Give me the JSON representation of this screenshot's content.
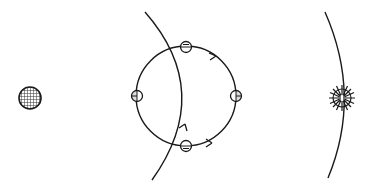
{
  "diagram": {
    "width": 367,
    "height": 185,
    "background": "#ffffff",
    "stroke": "#1a1a1a",
    "elements": {
      "hatched_disc": {
        "cx": 30,
        "cy": 98,
        "r": 11,
        "fill": "hatched"
      },
      "orbit_circle": {
        "cx": 186,
        "cy": 96,
        "r": 51,
        "arrows": [
          "upper-right",
          "lower-right",
          "crossing-arc-bottom"
        ]
      },
      "markers": [
        {
          "name": "top",
          "cx": 186,
          "cy": 47,
          "r": 6,
          "pattern": "upper-half-lines"
        },
        {
          "name": "left",
          "cx": 137,
          "cy": 96,
          "r": 6,
          "pattern": "left-filled"
        },
        {
          "name": "right",
          "cx": 236,
          "cy": 96,
          "r": 6,
          "pattern": "right-filled"
        },
        {
          "name": "bottom",
          "cx": 186,
          "cy": 146,
          "r": 6,
          "pattern": "lower-half-lines"
        }
      ],
      "crossing_arc": {
        "from": [
          145,
          12
        ],
        "through": [
          189,
          96
        ],
        "to": [
          152,
          180
        ]
      },
      "right_arc": {
        "from": [
          325,
          12
        ],
        "through": [
          342,
          98
        ],
        "to": [
          328,
          178
        ]
      },
      "sun_symbol": {
        "cx": 342,
        "cy": 98,
        "r": 10,
        "rays": 12
      }
    }
  }
}
